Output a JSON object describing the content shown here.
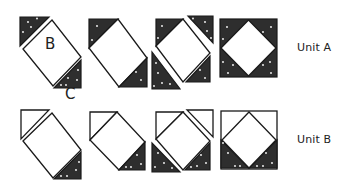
{
  "diagram": {
    "colors": {
      "dark_fabric": "#2e2e2e",
      "light_fabric": "#ffffff",
      "outline": "#1a1a1a",
      "text": "#222222"
    },
    "piece_labels": {
      "square": "B",
      "triangle": "C"
    },
    "rows": [
      {
        "name": "Unit A",
        "label": "Unit A",
        "steps": [
          {
            "step": 1,
            "description": "Dark triangles sewn to top-left and bottom-right of square B"
          },
          {
            "step": 2,
            "description": "Top-left and bottom-right triangles attached"
          },
          {
            "step": 3,
            "description": "Remaining dark triangles added at top-right and bottom-left"
          },
          {
            "step": 4,
            "description": "Completed square-in-a-square unit, all corners dark"
          }
        ]
      },
      {
        "name": "Unit B",
        "label": "Unit B",
        "steps": [
          {
            "step": 1,
            "description": "Light triangle at top-left, dark triangle at bottom-right of square"
          },
          {
            "step": 2,
            "description": "Top-left light and bottom-right dark triangles attached"
          },
          {
            "step": 3,
            "description": "Light triangle added at top-right, dark triangle at bottom-left"
          },
          {
            "step": 4,
            "description": "Completed unit with light top corners and dark bottom corners"
          }
        ]
      }
    ]
  }
}
